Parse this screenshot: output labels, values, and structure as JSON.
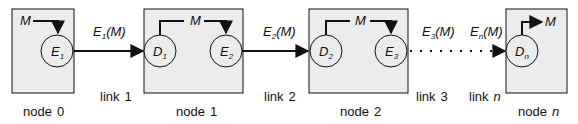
{
  "diagram": {
    "type": "relay-chain",
    "colors": {
      "box_fill": "#ececec",
      "stroke": "#111111",
      "background": "#ffffff"
    },
    "nodes": [
      {
        "id": "node0",
        "label": "node 0",
        "label_prefix": "node",
        "label_index": "0",
        "index_italic": false,
        "elements": [
          {
            "kind": "encoder",
            "symbol": "E",
            "sub": "1"
          }
        ],
        "message": {
          "text": "M",
          "role": "input"
        }
      },
      {
        "id": "node1",
        "label": "node 1",
        "label_prefix": "node",
        "label_index": "1",
        "index_italic": false,
        "elements": [
          {
            "kind": "decoder",
            "symbol": "D",
            "sub": "1"
          },
          {
            "kind": "encoder",
            "symbol": "E",
            "sub": "2"
          }
        ],
        "message": {
          "text": "M",
          "role": "relay"
        }
      },
      {
        "id": "node2",
        "label": "node 2",
        "label_prefix": "node",
        "label_index": "2",
        "index_italic": false,
        "elements": [
          {
            "kind": "decoder",
            "symbol": "D",
            "sub": "2"
          },
          {
            "kind": "encoder",
            "symbol": "E",
            "sub": "3"
          }
        ],
        "message": {
          "text": "M",
          "role": "relay"
        }
      },
      {
        "id": "noden",
        "label": "node n",
        "label_prefix": "node",
        "label_index": "n",
        "index_italic": true,
        "elements": [
          {
            "kind": "decoder",
            "symbol": "D",
            "sub": "n"
          }
        ],
        "message": {
          "text": "M",
          "role": "output"
        }
      }
    ],
    "links": [
      {
        "id": "link1",
        "label_prefix": "link",
        "label_index": "1",
        "index_italic": false,
        "signal": {
          "symbol": "E",
          "sub": "1",
          "arg": "(M)"
        },
        "style": "solid"
      },
      {
        "id": "link2",
        "label_prefix": "link",
        "label_index": "2",
        "index_italic": false,
        "signal": {
          "symbol": "E",
          "sub": "2",
          "arg": "(M)"
        },
        "style": "solid"
      },
      {
        "id": "link3",
        "label_prefix": "link",
        "label_index": "3",
        "index_italic": false,
        "signal": {
          "symbol": "E",
          "sub": "3",
          "arg": "(M)"
        },
        "style": "dotted"
      },
      {
        "id": "linkn",
        "label_prefix": "link",
        "label_index": "n",
        "index_italic": true,
        "signal": {
          "symbol": "E",
          "sub": "n",
          "arg": "(M)"
        },
        "style": "dotted"
      }
    ]
  }
}
